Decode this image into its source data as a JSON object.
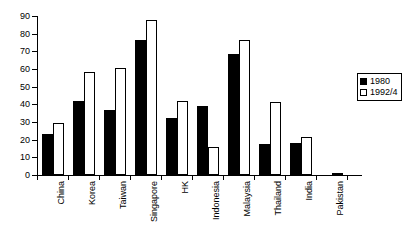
{
  "chart_data": {
    "type": "bar",
    "title": "",
    "subtitle": "",
    "xlabel": "",
    "ylabel": "",
    "ylim": [
      0,
      90
    ],
    "ytick_step": 10,
    "yticks": [
      0,
      10,
      20,
      30,
      40,
      50,
      60,
      70,
      80,
      90
    ],
    "grid": false,
    "legend_position": "right",
    "orientation": "vertical",
    "categories": [
      "China",
      "Korea",
      "Taiwan",
      "Singapore",
      "HK",
      "Indonesia",
      "Malaysia",
      "Thailand",
      "India",
      "Pakistan"
    ],
    "series": [
      {
        "name": "1980",
        "fill": "#000000",
        "values": [
          23,
          42,
          37,
          76.5,
          32,
          39,
          68.5,
          17.5,
          18,
          0
        ]
      },
      {
        "name": "1992/4",
        "fill": "#ffffff",
        "values": [
          29.5,
          58.5,
          60.5,
          88,
          42,
          16,
          76.5,
          41.5,
          21.5,
          1
        ]
      }
    ]
  },
  "legend": {
    "entries": [
      {
        "label": "1980"
      },
      {
        "label": "1992/4"
      }
    ]
  },
  "colors": {
    "series_1980": "#000000",
    "series_1992_4": "#ffffff",
    "axis": "#000000",
    "background": "#ffffff"
  }
}
